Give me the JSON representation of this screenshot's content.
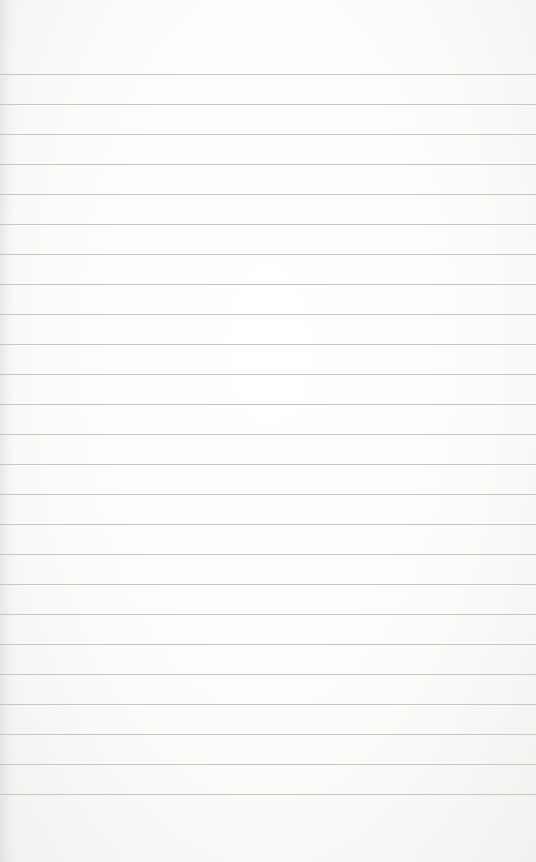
{
  "image": {
    "subject": "blank ruled notebook paper",
    "paper_color": "#fbfbfa",
    "rule_color": "#bdbdbb",
    "rules": {
      "count": 25,
      "first_y": 74,
      "spacing": 30
    }
  }
}
